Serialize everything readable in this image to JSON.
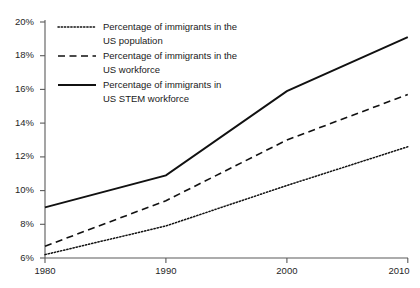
{
  "chart_data": {
    "type": "line",
    "title": "",
    "xlabel": "",
    "ylabel": "",
    "x": [
      1980,
      1990,
      2000,
      2010
    ],
    "xticklabels": [
      "1980",
      "1990",
      "2000",
      "2010"
    ],
    "yticks": [
      6,
      8,
      10,
      12,
      14,
      16,
      18,
      20
    ],
    "yticklabels": [
      "6%",
      "8%",
      "10%",
      "12%",
      "14%",
      "16%",
      "18%",
      "20%"
    ],
    "ylim": [
      6,
      20
    ],
    "xlim": [
      1980,
      2010
    ],
    "grid": false,
    "legend_position": "upper-left-inside",
    "series": [
      {
        "name": "Percentage of immigrants in the US population",
        "label_line1": "Percentage of immigrants in the",
        "label_line2": "US population",
        "style": "dotted",
        "color": "#111111",
        "values": [
          6.2,
          7.9,
          10.3,
          12.6
        ]
      },
      {
        "name": "Percentage of immigrants in the US workforce",
        "label_line1": "Percentage of immigrants in the",
        "label_line2": "US workforce",
        "style": "dashed",
        "color": "#111111",
        "values": [
          6.7,
          9.4,
          13.0,
          15.7
        ]
      },
      {
        "name": "Percentage of immigrants in US STEM workforce",
        "label_line1": "Percentage of immigrants in",
        "label_line2": "US STEM workforce",
        "style": "solid",
        "color": "#111111",
        "values": [
          9.0,
          10.9,
          15.9,
          19.1
        ]
      }
    ]
  }
}
